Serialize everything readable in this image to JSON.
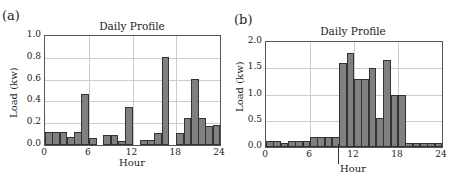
{
  "chart_data": [
    {
      "panel": "(a)",
      "type": "bar",
      "title": "Daily Profile",
      "xlabel": "Hour",
      "ylabel": "Load (kw)",
      "xlim": [
        0,
        24
      ],
      "ylim": [
        0,
        1.0
      ],
      "xticks": [
        "0",
        "6",
        "12",
        "18",
        "24"
      ],
      "yticks": [
        "0.0",
        "0.2",
        "0.4",
        "0.6",
        "0.8",
        "1.0"
      ],
      "grid": true,
      "categories": [
        0,
        1,
        2,
        3,
        4,
        5,
        6,
        7,
        8,
        9,
        10,
        11,
        12,
        13,
        14,
        15,
        16,
        17,
        18,
        19,
        20,
        21,
        22,
        23
      ],
      "values": [
        0.12,
        0.12,
        0.12,
        0.07,
        0.12,
        0.47,
        0.06,
        0,
        0.09,
        0.09,
        0.04,
        0.35,
        0,
        0.05,
        0.05,
        0.11,
        0.81,
        0,
        0.11,
        0.25,
        0.61,
        0.25,
        0.17,
        0.18
      ]
    },
    {
      "panel": "(b)",
      "type": "bar",
      "title": "Daily Profile",
      "xlabel": "Hour",
      "ylabel": "Load (kw)",
      "xlim": [
        0,
        24
      ],
      "ylim": [
        0,
        2.0
      ],
      "xticks": [
        "0",
        "6",
        "12",
        "18",
        "24"
      ],
      "yticks": [
        "0.0",
        "0.5",
        "1.0",
        "1.5",
        "2.0"
      ],
      "grid": true,
      "annotation": "vertical marker at hour 10",
      "categories": [
        0,
        1,
        2,
        3,
        4,
        5,
        6,
        7,
        8,
        9,
        10,
        11,
        12,
        13,
        14,
        15,
        16,
        17,
        18,
        19,
        20,
        21,
        22,
        23
      ],
      "values": [
        0.12,
        0.12,
        0.07,
        0.12,
        0.12,
        0.12,
        0.2,
        0.2,
        0.2,
        0.2,
        1.6,
        1.8,
        1.3,
        1.3,
        1.5,
        0.55,
        1.65,
        1.0,
        1.0,
        0.08,
        0.08,
        0.08,
        0.08,
        0.08
      ]
    }
  ],
  "bar_color": "#808080"
}
